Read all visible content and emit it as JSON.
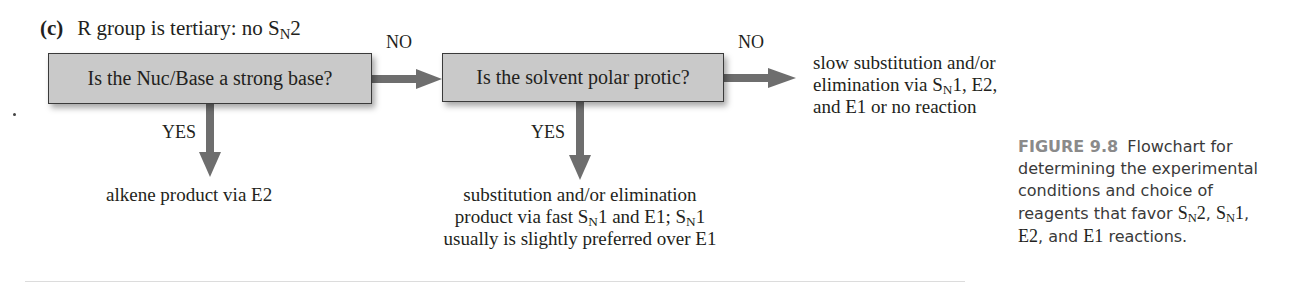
{
  "figure": {
    "part_letter": "(c)",
    "part_title_prefix": "R group is tertiary: no S",
    "part_title_sub": "N",
    "part_title_suffix": "2",
    "nodes": {
      "question1": "Is the Nuc/Base a strong base?",
      "question2": "Is the solvent polar protic?"
    },
    "edges": {
      "q1_no": "NO",
      "q1_yes": "YES",
      "q2_no": "NO",
      "q2_yes": "YES"
    },
    "outcomes": {
      "q1_yes_result": "alkene product via E2",
      "q2_no_result": {
        "line1": "slow substitution and/or",
        "line2_prefix": "elimination via S",
        "line2_sub": "N",
        "line2_suffix": "1, E2,",
        "line3": "and E1 or no reaction"
      },
      "q2_yes_result": {
        "line1": "substitution and/or elimination",
        "line2_a": "product via fast S",
        "line2_sub1": "N",
        "line2_b": "1 and E1; S",
        "line2_sub2": "N",
        "line2_c": "1",
        "line3": "usually is slightly preferred over E1"
      }
    },
    "caption": {
      "number": "FIGURE 9.8",
      "line1": "Flowchart for",
      "line2": "determining the experimental",
      "line3": "conditions and choice of",
      "line4_prefix": "reagents that favor ",
      "sn": "S",
      "n": "N",
      "two": "2",
      "comma": ", ",
      "one": "1",
      "line4_end": ",",
      "e2": "E2",
      "line5_mid": ", and ",
      "e1": "E1",
      "line5_end": " reactions."
    },
    "colors": {
      "box_fill": "#c9c9c9",
      "arrow": "#6e6e6e",
      "caption_label": "#8a8a8a"
    }
  }
}
